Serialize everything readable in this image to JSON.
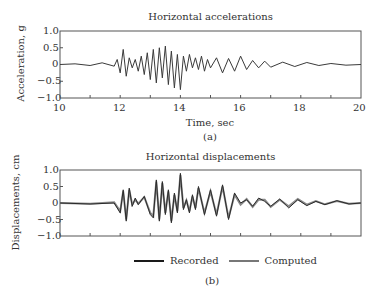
{
  "figure": {
    "panel_a": {
      "title": "Horizontal accelerations",
      "ylabel": "Acceleration, g",
      "xlabel": "Time, sec",
      "caption": "(a)",
      "yticks": [
        "1.0",
        "0.5",
        "0",
        "−0.5",
        "−1.0"
      ],
      "xticks": [
        "10",
        "12",
        "14",
        "16",
        "18",
        "20"
      ]
    },
    "panel_b": {
      "title": "Horizontal displacements",
      "ylabel": "Displacements, cm",
      "caption": "(b)",
      "yticks": [
        "1.0",
        "0.5",
        "0",
        "−0.5",
        "−1.0"
      ]
    },
    "legend": {
      "recorded": "Recorded",
      "computed": "Computed",
      "recorded_color": "#1a1a1a",
      "computed_color": "#777777"
    }
  },
  "chart_data": [
    {
      "type": "line",
      "title": "Horizontal accelerations",
      "xlabel": "Time, sec",
      "ylabel": "Acceleration, g",
      "xlim": [
        10,
        20
      ],
      "ylim": [
        -1.0,
        1.0
      ],
      "xticks": [
        10,
        12,
        14,
        16,
        18,
        20
      ],
      "yticks": [
        -1.0,
        -0.5,
        0,
        0.5,
        1.0
      ],
      "grid": false,
      "caption": "(a)",
      "series": [
        {
          "name": "Recorded",
          "x": [
            10.0,
            10.5,
            11.0,
            11.4,
            11.8,
            11.9,
            12.0,
            12.1,
            12.2,
            12.3,
            12.4,
            12.5,
            12.6,
            12.7,
            12.8,
            12.9,
            13.0,
            13.1,
            13.2,
            13.3,
            13.4,
            13.5,
            13.6,
            13.7,
            13.8,
            13.9,
            14.0,
            14.1,
            14.2,
            14.3,
            14.4,
            14.5,
            14.6,
            14.7,
            14.8,
            14.9,
            15.0,
            15.2,
            15.4,
            15.6,
            15.8,
            16.0,
            16.2,
            16.4,
            16.6,
            16.8,
            17.0,
            17.4,
            17.8,
            18.2,
            18.6,
            19.0,
            19.5,
            20.0
          ],
          "y": [
            0.0,
            0.02,
            -0.03,
            0.05,
            -0.05,
            0.15,
            -0.25,
            0.45,
            -0.35,
            0.2,
            -0.1,
            0.15,
            -0.2,
            0.25,
            -0.3,
            0.35,
            -0.45,
            0.45,
            -0.55,
            0.5,
            -0.4,
            0.55,
            -0.6,
            0.4,
            -0.7,
            0.3,
            -0.75,
            0.25,
            -0.2,
            0.3,
            -0.1,
            0.2,
            -0.15,
            0.25,
            -0.2,
            0.15,
            -0.1,
            0.2,
            -0.25,
            0.18,
            -0.2,
            0.25,
            -0.15,
            0.12,
            -0.1,
            0.1,
            -0.08,
            0.07,
            -0.06,
            0.06,
            -0.03,
            0.03,
            -0.02,
            0.0
          ]
        }
      ]
    },
    {
      "type": "line",
      "title": "Horizontal displacements",
      "xlabel": "",
      "ylabel": "Displacements, cm",
      "xlim": [
        10,
        20
      ],
      "ylim": [
        -1.0,
        1.0
      ],
      "yticks": [
        -1.0,
        -0.5,
        0,
        0.5,
        1.0
      ],
      "grid": false,
      "legend_position": "bottom",
      "caption": "(b)",
      "series": [
        {
          "name": "Recorded",
          "x": [
            10.0,
            11.0,
            11.8,
            12.0,
            12.1,
            12.2,
            12.3,
            12.4,
            12.5,
            12.6,
            12.8,
            13.0,
            13.1,
            13.2,
            13.3,
            13.4,
            13.5,
            13.6,
            13.7,
            13.8,
            13.9,
            14.0,
            14.1,
            14.2,
            14.3,
            14.4,
            14.5,
            14.6,
            14.8,
            15.0,
            15.2,
            15.4,
            15.6,
            15.8,
            16.0,
            16.2,
            16.4,
            16.6,
            16.8,
            17.0,
            17.3,
            17.6,
            17.9,
            18.2,
            18.5,
            18.8,
            19.2,
            19.6,
            20.0
          ],
          "y": [
            0.0,
            -0.03,
            0.0,
            -0.3,
            0.4,
            -0.55,
            0.45,
            -0.1,
            0.15,
            -0.05,
            0.2,
            -0.35,
            -0.45,
            0.7,
            -0.55,
            0.65,
            -0.35,
            0.4,
            -0.6,
            0.3,
            -0.3,
            0.9,
            -0.2,
            0.1,
            -0.3,
            0.25,
            -0.2,
            0.5,
            -0.35,
            0.4,
            -0.4,
            0.55,
            -0.5,
            0.3,
            0.0,
            0.1,
            -0.1,
            0.15,
            0.05,
            -0.1,
            0.12,
            -0.15,
            0.1,
            -0.08,
            0.05,
            -0.05,
            0.07,
            -0.03,
            0.0
          ]
        },
        {
          "name": "Computed",
          "x": [
            10.0,
            11.0,
            11.8,
            12.0,
            12.1,
            12.2,
            12.3,
            12.4,
            12.5,
            12.6,
            12.8,
            13.0,
            13.1,
            13.2,
            13.3,
            13.4,
            13.5,
            13.6,
            13.7,
            13.8,
            13.9,
            14.0,
            14.1,
            14.2,
            14.3,
            14.4,
            14.5,
            14.6,
            14.8,
            15.0,
            15.2,
            15.4,
            15.6,
            15.8,
            16.0,
            16.2,
            16.4,
            16.6,
            16.8,
            17.0,
            17.3,
            17.6,
            17.9,
            18.2,
            18.5,
            18.8,
            19.2,
            19.6,
            20.0
          ],
          "y": [
            0.0,
            -0.02,
            0.02,
            -0.25,
            0.35,
            -0.5,
            0.4,
            -0.05,
            0.1,
            -0.02,
            0.18,
            -0.3,
            -0.4,
            0.65,
            -0.5,
            0.6,
            -0.3,
            0.35,
            -0.55,
            0.25,
            -0.25,
            0.85,
            -0.15,
            0.08,
            -0.25,
            0.2,
            -0.15,
            0.45,
            -0.3,
            0.35,
            -0.35,
            0.5,
            -0.45,
            0.25,
            -0.05,
            0.12,
            -0.12,
            0.1,
            0.1,
            -0.12,
            0.1,
            -0.1,
            0.12,
            -0.05,
            0.06,
            -0.04,
            0.06,
            -0.02,
            0.0
          ]
        }
      ]
    }
  ]
}
